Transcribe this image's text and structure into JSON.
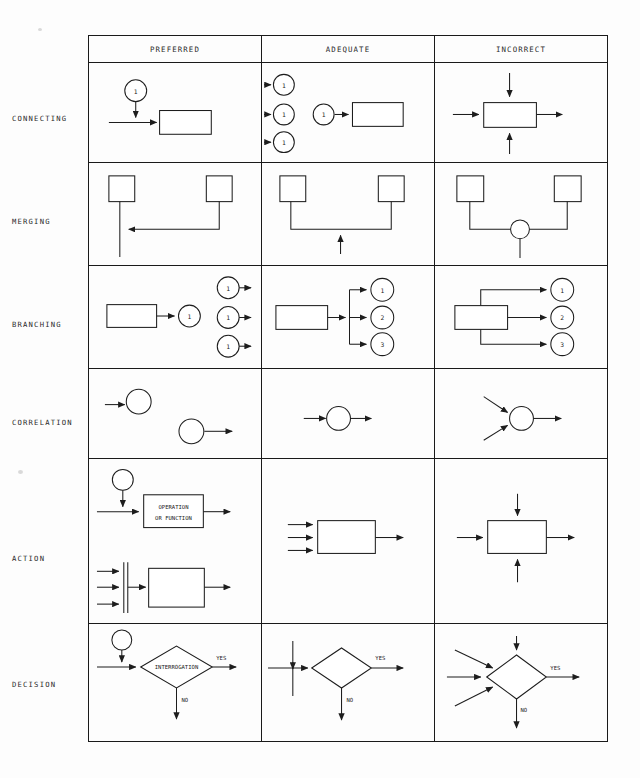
{
  "figure": {
    "type": "flowchart-convention-table",
    "columns": [
      "PREFERRED",
      "ADEQUATE",
      "INCORRECT"
    ],
    "rows": [
      "CONNECTING",
      "MERGING",
      "BRANCHING",
      "CORRELATION",
      "ACTION",
      "DECISION"
    ]
  },
  "header": {
    "col1": "PREFERRED",
    "col2": "ADEQUATE",
    "col3": "INCORRECT"
  },
  "rowlabels": {
    "connecting": "CONNECTING",
    "merging": "MERGING",
    "branching": "BRANCHING",
    "correlation": "CORRELATION",
    "action": "ACTION",
    "decision": "DECISION"
  },
  "connectors": {
    "one": "1",
    "two": "2",
    "three": "3"
  },
  "labels": {
    "operation_line1": "OPERATION",
    "operation_line2": "OR FUNCTION",
    "interrogation": "INTERROGATION",
    "yes": "YES",
    "no": "NO"
  },
  "colors": {
    "ink": "#1d1d1d",
    "paper": "#fdfdfd",
    "text": "#2b2b2b"
  }
}
